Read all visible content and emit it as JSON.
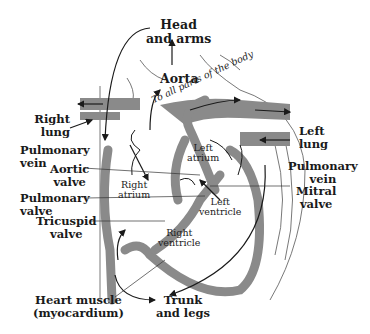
{
  "diagram": {
    "colors": {
      "wall": "#8a8a8a",
      "line": "#1a1a1a",
      "background": "#ffffff"
    },
    "labels": {
      "head_arms_1": "Head",
      "head_arms_2": "and arms",
      "aorta": "Aorta",
      "to_all_parts": "To all parts of the body",
      "right_lung_1": "Right",
      "right_lung_2": "lung",
      "left_lung_1": "Left",
      "left_lung_2": "lung",
      "pulmonary_vein_left_1": "Pulmonary",
      "pulmonary_vein_left_2": "vein",
      "pulmonary_vein_right_1": "Pulmonary",
      "pulmonary_vein_right_2": "vein",
      "aortic_valve_1": "Aortic",
      "aortic_valve_2": "valve",
      "left_atrium_1": "Left",
      "left_atrium_2": "atrium",
      "right_atrium_1": "Right",
      "right_atrium_2": "atrium",
      "left_ventricle_1": "Left",
      "left_ventricle_2": "ventricle",
      "right_ventricle_1": "Right",
      "right_ventricle_2": "ventricle",
      "mitral_valve_1": "Mitral",
      "mitral_valve_2": "valve",
      "pulmonary_valve_1": "Pulmonary",
      "pulmonary_valve_2": "valve",
      "tricuspid_valve_1": "Tricuspid",
      "tricuspid_valve_2": "valve",
      "heart_muscle_1": "Heart muscle",
      "heart_muscle_2": "(myocardium)",
      "trunk_legs_1": "Trunk",
      "trunk_legs_2": "and legs"
    }
  }
}
